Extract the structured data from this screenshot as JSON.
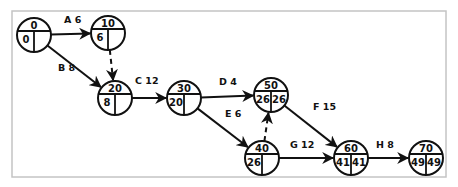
{
  "diagram": {
    "type": "activity-on-arrow network (CPM)",
    "nodes": [
      {
        "id": "0",
        "label": "0",
        "es": "0",
        "lf": "",
        "x": 34,
        "y": 35,
        "show_lf": false
      },
      {
        "id": "10",
        "label": "10",
        "es": "6",
        "lf": "",
        "x": 108,
        "y": 33,
        "show_lf": false
      },
      {
        "id": "20",
        "label": "20",
        "es": "8",
        "lf": "",
        "x": 115,
        "y": 98,
        "show_lf": false
      },
      {
        "id": "30",
        "label": "30",
        "es": "20",
        "lf": "",
        "x": 184,
        "y": 98,
        "show_lf": false
      },
      {
        "id": "50",
        "label": "50",
        "es": "26",
        "lf": "26",
        "x": 271,
        "y": 95,
        "show_lf": true
      },
      {
        "id": "40",
        "label": "40",
        "es": "26",
        "lf": "",
        "x": 262,
        "y": 158,
        "show_lf": false
      },
      {
        "id": "60",
        "label": "60",
        "es": "41",
        "lf": "41",
        "x": 351,
        "y": 158,
        "show_lf": true
      },
      {
        "id": "70",
        "label": "70",
        "es": "49",
        "lf": "49",
        "x": 426,
        "y": 158,
        "show_lf": true
      }
    ],
    "edges": [
      {
        "activity": "A",
        "duration": "6",
        "label": "A 6",
        "from": "0",
        "to": "10",
        "dummy": false
      },
      {
        "activity": "B",
        "duration": "8",
        "label": "B 8",
        "from": "0",
        "to": "20",
        "dummy": false
      },
      {
        "activity": "",
        "duration": "",
        "label": "",
        "from": "10",
        "to": "20",
        "dummy": true
      },
      {
        "activity": "C",
        "duration": "12",
        "label": "C 12",
        "from": "20",
        "to": "30",
        "dummy": false
      },
      {
        "activity": "D",
        "duration": "4",
        "label": "D 4",
        "from": "30",
        "to": "50",
        "dummy": false
      },
      {
        "activity": "E",
        "duration": "6",
        "label": "E 6",
        "from": "30",
        "to": "40",
        "dummy": false
      },
      {
        "activity": "",
        "duration": "",
        "label": "",
        "from": "40",
        "to": "50",
        "dummy": true
      },
      {
        "activity": "F",
        "duration": "15",
        "label": "F 15",
        "from": "50",
        "to": "60",
        "dummy": false
      },
      {
        "activity": "G",
        "duration": "12",
        "label": "G 12",
        "from": "40",
        "to": "60",
        "dummy": false
      },
      {
        "activity": "H",
        "duration": "8",
        "label": "H 8",
        "from": "60",
        "to": "70",
        "dummy": false
      }
    ],
    "edge_labels": {
      "A": {
        "text": "A 6",
        "x": 64,
        "y": 23
      },
      "B": {
        "text": "B 8",
        "x": 58,
        "y": 71
      },
      "C": {
        "text": "C 12",
        "x": 135,
        "y": 84
      },
      "D": {
        "text": "D 4",
        "x": 219,
        "y": 85
      },
      "E": {
        "text": "E 6",
        "x": 225,
        "y": 117
      },
      "F": {
        "text": "F 15",
        "x": 313,
        "y": 110
      },
      "G": {
        "text": "G 12",
        "x": 290,
        "y": 148
      },
      "H": {
        "text": "H 8",
        "x": 376,
        "y": 148
      }
    }
  }
}
